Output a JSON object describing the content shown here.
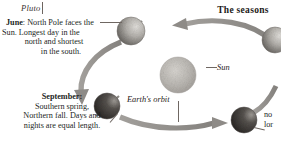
{
  "page": {
    "running_head": "Pluto",
    "title": "The seasons",
    "background_color": "#ffffff",
    "ink_color": "#231f1d",
    "arrow_color": "#8e8b87"
  },
  "captions": {
    "june": {
      "marker": "June",
      "separator": ":",
      "line1": " North Pole faces the",
      "line2": "Sun. Longest day in the",
      "line3": "north and shortest",
      "line4": "in the south."
    },
    "september": {
      "line1": "September:",
      "line2": "Southern spring,",
      "line3": "Northern fall. Days and",
      "line4": "nights are equal length."
    },
    "right_edge_clipped": {
      "line1": "no",
      "line2": "lor"
    }
  },
  "labels": {
    "sun": "Sun",
    "orbit": "Earth's orbit"
  },
  "diagram": {
    "sun": {
      "cx": 178,
      "cy": 75,
      "r": 18,
      "fill": "#b8b5b0"
    },
    "earths": [
      {
        "name": "earth-june",
        "cx": 131,
        "cy": 31,
        "r": 14,
        "lit": "high"
      },
      {
        "name": "earth-september",
        "cx": 107,
        "cy": 106,
        "r": 13,
        "lit": "low"
      },
      {
        "name": "earth-december",
        "cx": 244,
        "cy": 120,
        "r": 13,
        "lit": "low"
      },
      {
        "name": "earth-march",
        "cx": 274,
        "cy": 40,
        "r": 13,
        "lit": "high"
      }
    ],
    "orbit_arrows": [
      {
        "name": "orbit-arrow-top",
        "direction": "left"
      },
      {
        "name": "orbit-arrow-left",
        "direction": "down"
      },
      {
        "name": "orbit-arrow-bottom",
        "direction": "right"
      }
    ]
  }
}
